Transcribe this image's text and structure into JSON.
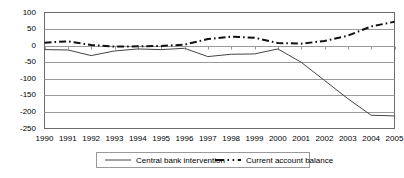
{
  "chart_data": {
    "type": "line",
    "title": "",
    "xlabel": "",
    "ylabel": "",
    "categories": [
      "1990",
      "1991",
      "1992",
      "1993",
      "1994",
      "1995",
      "1996",
      "1997",
      "1998",
      "1999",
      "2000",
      "2001",
      "2002",
      "2003",
      "2004",
      "2005"
    ],
    "ylim": [
      -250,
      100
    ],
    "xlim": [
      1990,
      2005
    ],
    "yticks": [
      100,
      50,
      0,
      -50,
      -100,
      -150,
      -200,
      -250
    ],
    "ytick_labels": [
      "100",
      "50",
      "0",
      "-50",
      "-100",
      "-150",
      "-200",
      "-250"
    ],
    "grid": true,
    "grid_axis": "y",
    "legend_position": "bottom",
    "series": [
      {
        "name": "Central bank intervention",
        "style": "solid",
        "color": "#444444",
        "values": [
          -12,
          -13,
          -30,
          -16,
          -10,
          -12,
          -8,
          -33,
          -26,
          -25,
          -10,
          -50,
          -105,
          -160,
          -210,
          -212
        ]
      },
      {
        "name": "Current account balance",
        "style": "dash-dot",
        "color": "#111111",
        "values": [
          9,
          13,
          2,
          -3,
          -2,
          -1,
          3,
          20,
          27,
          24,
          8,
          6,
          14,
          30,
          58,
          72
        ]
      }
    ]
  },
  "axes": {
    "ytick_labels": [
      "100",
      "50",
      "0",
      "-50",
      "-100",
      "-150",
      "-200",
      "-250"
    ],
    "xtick_labels": [
      "1990",
      "1991",
      "1992",
      "1993",
      "1994",
      "1995",
      "1996",
      "1997",
      "1998",
      "1999",
      "2000",
      "2001",
      "2002",
      "2003",
      "2004",
      "2005"
    ]
  },
  "legend": {
    "entries": [
      {
        "label": "Central bank intervention",
        "style": "solid"
      },
      {
        "label": "Current account balance",
        "style": "dash-dot"
      }
    ]
  },
  "colors": {
    "plot_border": "#6b6b6b",
    "gridline": "#9a9a9a",
    "series_solid": "#444444",
    "series_dashdot": "#111111",
    "text": "#000000",
    "background": "#ffffff"
  }
}
